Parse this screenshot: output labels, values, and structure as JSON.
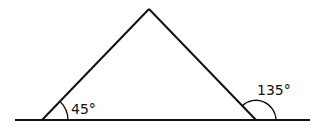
{
  "diagram": {
    "type": "geometry",
    "colors": {
      "line": "#111111",
      "background": "#ffffff"
    },
    "baseline": {
      "x1": 15,
      "y1": 120,
      "x2": 310,
      "y2": 120
    },
    "triangle": {
      "apex": [
        149,
        9
      ],
      "left_vertex": [
        42,
        120
      ],
      "right_vertex": [
        256,
        120
      ]
    },
    "angles": [
      {
        "id": "interior-left",
        "label": "45°",
        "vertex": [
          42,
          120
        ]
      },
      {
        "id": "exterior-right",
        "label": "135°",
        "vertex": [
          256,
          120
        ]
      }
    ]
  }
}
